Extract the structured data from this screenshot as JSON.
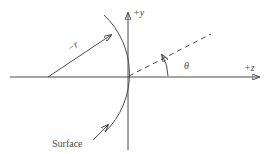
{
  "figure": {
    "colors": {
      "background": "#ffffff",
      "line": "#4a4a4a"
    },
    "labels": {
      "y_axis": "+y",
      "z_axis": "+z",
      "radius": "−r",
      "angle": "θ",
      "surface": "Surface"
    }
  }
}
